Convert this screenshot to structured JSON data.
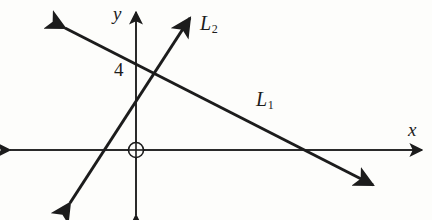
{
  "figure": {
    "type": "coordinate-plane-two-lines",
    "background_color": "#fdfdfb",
    "stroke_color": "#1c1c1c",
    "axes": {
      "x_label": "x",
      "y_label": "y",
      "origin_symbol": "circled-origin",
      "x_axis": {
        "from": [
          10,
          150
        ],
        "to": [
          422,
          150
        ],
        "arrows": "both"
      },
      "y_axis": {
        "from": [
          136,
          215
        ],
        "to": [
          136,
          12
        ],
        "arrows": "both"
      }
    },
    "y_intercept_label": "4",
    "lines": [
      {
        "name": "L_1",
        "label": "L",
        "subscript": "1",
        "from": [
          65,
          28
        ],
        "to": [
          373,
          185
        ],
        "arrows": "both",
        "y_intercept_point": [
          136,
          64
        ],
        "x_intercept_point": [
          308,
          150
        ],
        "slope_sign": "negative"
      },
      {
        "name": "L_2",
        "label": "L",
        "subscript": "2",
        "from": [
          70,
          203
        ],
        "to": [
          190,
          18
        ],
        "arrows": "both",
        "x_intercept_point": [
          112,
          150
        ],
        "slope_sign": "positive"
      }
    ],
    "intersection_point": [
      155,
      73
    ]
  }
}
